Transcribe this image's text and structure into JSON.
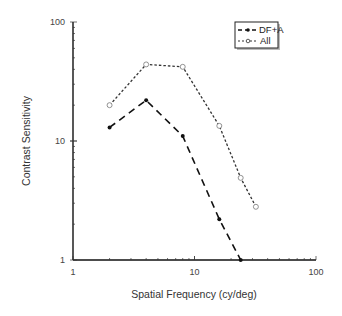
{
  "chart_data": {
    "type": "line",
    "title": "",
    "xlabel": "Spatial Frequency (cy/deg)",
    "ylabel": "Contrast Sensitivity",
    "xscale": "log",
    "yscale": "log",
    "xlim": [
      1,
      100
    ],
    "ylim": [
      1,
      100
    ],
    "x_ticks": [
      "1",
      "10",
      "100"
    ],
    "y_ticks": [
      "1",
      "10",
      "100"
    ],
    "grid": false,
    "legend_position": "upper right",
    "series": [
      {
        "name": "DF+A",
        "style": "long-dash",
        "marker": "filled-circle",
        "color": "#111111",
        "x": [
          2,
          4,
          8,
          16,
          24
        ],
        "values": [
          13,
          22,
          11,
          2.2,
          1.0
        ]
      },
      {
        "name": "All",
        "style": "short-dash",
        "marker": "open-circle",
        "color": "#333333",
        "x": [
          2,
          4,
          8,
          16,
          24,
          32
        ],
        "values": [
          20,
          44,
          42,
          13.4,
          4.9,
          2.8
        ]
      }
    ]
  }
}
